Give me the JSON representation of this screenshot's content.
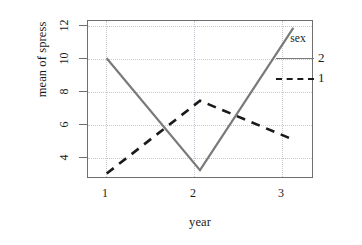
{
  "chart_data": {
    "type": "line",
    "title": "",
    "xlabel": "year",
    "ylabel": "mean of spress",
    "x": [
      1,
      2,
      3
    ],
    "xticklabels": [
      "1",
      "2",
      "3"
    ],
    "yticklabels": [
      "4",
      "6",
      "8",
      "10",
      "12"
    ],
    "yticks": [
      4,
      6,
      8,
      10,
      12
    ],
    "ylim": [
      3.1,
      12.3
    ],
    "xlim": [
      0.8,
      3.2
    ],
    "grid": "dotted",
    "legend_position": "top-right",
    "legend_title": "sex",
    "series": [
      {
        "name": "2",
        "linestyle": "solid",
        "color": "#7a7a7a",
        "values": [
          10.1,
          3.5,
          11.9
        ]
      },
      {
        "name": "1",
        "linestyle": "dashed",
        "color": "#1a1a1a",
        "values": [
          3.3,
          7.6,
          5.3
        ]
      }
    ]
  },
  "axes": {
    "y_title": "mean of spress",
    "x_title": "year",
    "y_tick_labels": [
      "12",
      "10",
      "8",
      "6",
      "4"
    ],
    "x_tick_labels": [
      "1",
      "2",
      "3"
    ]
  },
  "legend": {
    "title": "sex",
    "entries": [
      {
        "label": "2",
        "style": "solid"
      },
      {
        "label": "1",
        "style": "dashed"
      }
    ]
  }
}
